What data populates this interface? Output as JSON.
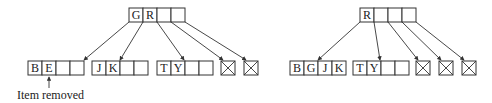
{
  "diagram": {
    "type": "btree-deletion",
    "colors": {
      "stroke": "#333333",
      "text": "#222222",
      "background": "#ffffff"
    },
    "before": {
      "root": {
        "keys": [
          "G",
          "R",
          "",
          ""
        ]
      },
      "children": [
        {
          "kind": "node",
          "keys": [
            "B",
            "E",
            "",
            ""
          ]
        },
        {
          "kind": "node",
          "keys": [
            "J",
            "K",
            "",
            ""
          ]
        },
        {
          "kind": "node",
          "keys": [
            "T",
            "Y",
            "",
            ""
          ]
        },
        {
          "kind": "null"
        },
        {
          "kind": "null"
        }
      ],
      "annotation": {
        "text": "Item removed",
        "target_key": "E"
      }
    },
    "after": {
      "root": {
        "keys": [
          "R",
          "",
          "",
          ""
        ]
      },
      "children": [
        {
          "kind": "node",
          "keys": [
            "B",
            "G",
            "J",
            "K"
          ]
        },
        {
          "kind": "node",
          "keys": [
            "T",
            "Y",
            "",
            ""
          ]
        },
        {
          "kind": "null"
        },
        {
          "kind": "null"
        },
        {
          "kind": "null"
        }
      ]
    }
  }
}
